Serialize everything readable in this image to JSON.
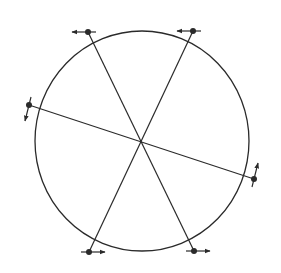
{
  "diagram": {
    "stroke_color": "#2a2a2a",
    "background": "#ffffff",
    "circle": {
      "cx": 142,
      "cy": 141,
      "rx": 107,
      "ry": 110
    },
    "center": {
      "x": 141,
      "y": 142
    },
    "lines": [
      {
        "name": "line-a",
        "x1": 88,
        "y1": 32,
        "x2": 194,
        "y2": 251
      },
      {
        "name": "line-b",
        "x1": 193,
        "y1": 31,
        "x2": 89,
        "y2": 252
      },
      {
        "name": "line-c",
        "x1": 29,
        "y1": 105,
        "x2": 254,
        "y2": 179
      }
    ],
    "points": [
      {
        "name": "top-left",
        "x": 88,
        "y": 32,
        "arrow": "left"
      },
      {
        "name": "top-right",
        "x": 193,
        "y": 31,
        "arrow": "left"
      },
      {
        "name": "left",
        "x": 29,
        "y": 105,
        "arrow": "down"
      },
      {
        "name": "right",
        "x": 254,
        "y": 179,
        "arrow": "up"
      },
      {
        "name": "bottom-left",
        "x": 89,
        "y": 252,
        "arrow": "right"
      },
      {
        "name": "bottom-right",
        "x": 194,
        "y": 251,
        "arrow": "right"
      }
    ]
  }
}
